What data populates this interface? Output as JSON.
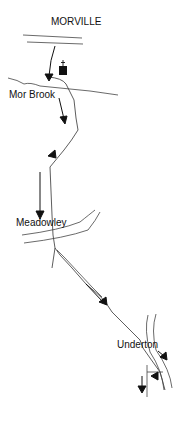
{
  "map": {
    "places": [
      {
        "id": "morville",
        "label": "MORVILLE"
      },
      {
        "id": "mor-brook",
        "label": "Mor Brook"
      },
      {
        "id": "meadowley",
        "label": "Meadowley"
      },
      {
        "id": "underton",
        "label": "Underton"
      }
    ],
    "symbols": [
      {
        "id": "church",
        "icon": "church-icon"
      }
    ],
    "colors": {
      "line": "#333333",
      "arrow": "#111111",
      "background": "#ffffff"
    }
  }
}
